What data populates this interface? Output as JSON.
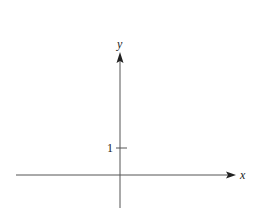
{
  "diagram": {
    "type": "coordinate-axes",
    "x_axis": {
      "label": "x",
      "arrow": "right"
    },
    "y_axis": {
      "label": "y",
      "arrow": "up"
    },
    "ticks": [
      {
        "axis": "y",
        "value": 1,
        "label": "1"
      }
    ],
    "colors": {
      "axis": "#555555",
      "text": "#222222",
      "background": "#ffffff"
    }
  }
}
